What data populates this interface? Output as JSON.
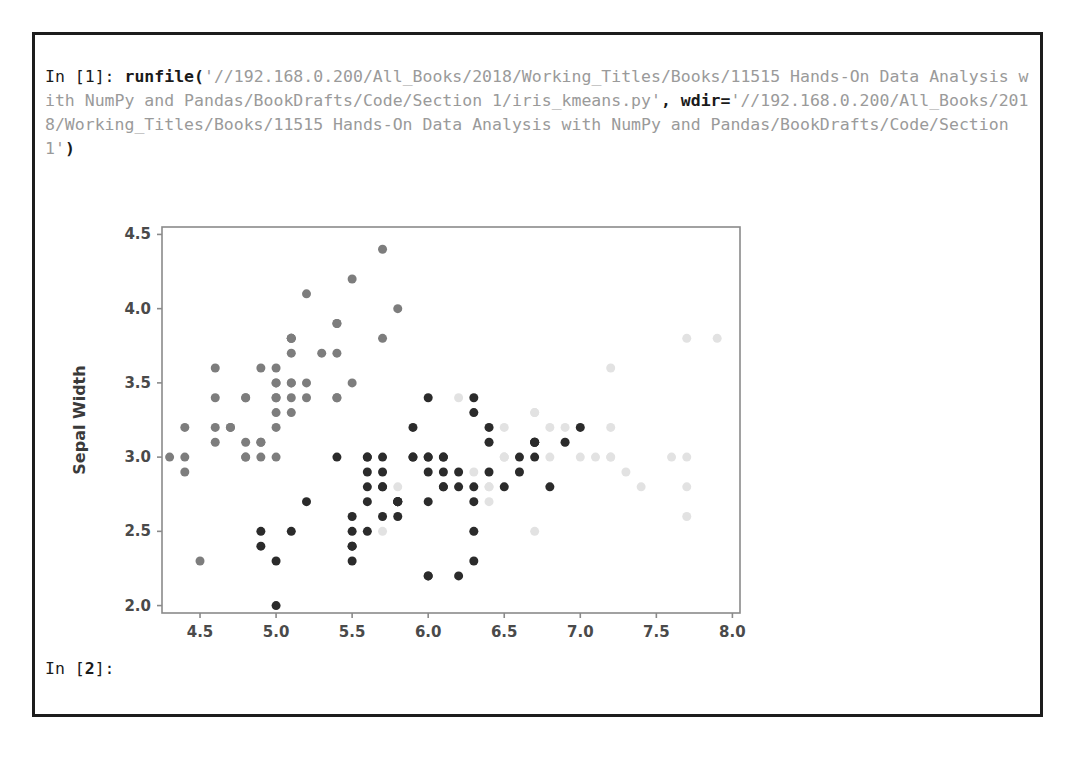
{
  "console": {
    "input_prompt_1": "In [1]:",
    "function_call": "runfile(",
    "arg1_string": "'//192.168.0.200/All_Books/2018/Working_Titles/Books/11515 Hands-On Data Analysis with NumPy and Pandas/BookDrafts/Code/Section 1/iris_kmeans.py'",
    "comma": ",",
    "kwarg_name": "wdir=",
    "arg2_string": "'//192.168.0.200/All_Books/2018/Working_Titles/Books/11515 Hands-On Data Analysis with NumPy and Pandas/BookDrafts/Code/Section 1'",
    "close_paren": ")",
    "input_prompt_2_pre": "In [",
    "input_prompt_2_num": "2",
    "input_prompt_2_post": "]:",
    "full_line_1": "In [1]: runfile('//192.168.0.200/All_Books/2018/Working_Titles/Books/11515 Hands-",
    "full_line_2": "On Data Analysis with NumPy and Pandas/BookDrafts/Code/Section 1/iris_kmeans.py',",
    "full_line_3": "wdir='//192.168.0.200/All_Books/2018/Working_Titles/Books/11515 Hands-On Data",
    "full_line_4": "Analysis with NumPy and Pandas/BookDrafts/Code/Section 1')"
  },
  "colors": {
    "frame_border": "#1c1c1c",
    "axis": "#8a8a8a",
    "text_dark": "#1a1a1a",
    "text_string": "#9a9a9a",
    "cluster_dark": "#2b2b2b",
    "cluster_medium": "#7d7d7d",
    "cluster_light": "#e2e2e2"
  },
  "chart_data": {
    "type": "scatter",
    "title": "",
    "xlabel": "Sepal Length",
    "ylabel": "Sepal Width",
    "xlim": [
      4.25,
      8.05
    ],
    "ylim": [
      1.95,
      4.55
    ],
    "xticks": [
      4.5,
      5.0,
      5.5,
      6.0,
      6.5,
      7.0,
      7.5,
      8.0
    ],
    "xtick_labels": [
      "4.5",
      "5.0",
      "5.5",
      "6.0",
      "6.5",
      "7.0",
      "7.5",
      "8.0"
    ],
    "yticks": [
      2.0,
      2.5,
      3.0,
      3.5,
      4.0,
      4.5
    ],
    "ytick_labels": [
      "2.0",
      "2.5",
      "3.0",
      "3.5",
      "4.0",
      "4.5"
    ],
    "grid": false,
    "legend": "none",
    "marker_size": 9,
    "series": [
      {
        "name": "cluster-0",
        "color": "#7d7d7d",
        "points": [
          [
            5.1,
            3.5
          ],
          [
            4.9,
            3.0
          ],
          [
            4.7,
            3.2
          ],
          [
            4.6,
            3.1
          ],
          [
            5.0,
            3.6
          ],
          [
            5.4,
            3.9
          ],
          [
            4.6,
            3.4
          ],
          [
            5.0,
            3.4
          ],
          [
            4.4,
            2.9
          ],
          [
            4.9,
            3.1
          ],
          [
            5.4,
            3.7
          ],
          [
            4.8,
            3.4
          ],
          [
            4.8,
            3.0
          ],
          [
            4.3,
            3.0
          ],
          [
            5.8,
            4.0
          ],
          [
            5.7,
            4.4
          ],
          [
            5.4,
            3.9
          ],
          [
            5.1,
            3.5
          ],
          [
            5.7,
            3.8
          ],
          [
            5.1,
            3.8
          ],
          [
            5.4,
            3.4
          ],
          [
            5.1,
            3.7
          ],
          [
            4.6,
            3.6
          ],
          [
            5.1,
            3.3
          ],
          [
            4.8,
            3.4
          ],
          [
            5.0,
            3.0
          ],
          [
            5.0,
            3.4
          ],
          [
            5.2,
            3.5
          ],
          [
            5.2,
            3.4
          ],
          [
            4.7,
            3.2
          ],
          [
            4.8,
            3.1
          ],
          [
            5.4,
            3.4
          ],
          [
            5.2,
            4.1
          ],
          [
            5.5,
            4.2
          ],
          [
            4.9,
            3.1
          ],
          [
            5.0,
            3.2
          ],
          [
            5.5,
            3.5
          ],
          [
            4.9,
            3.6
          ],
          [
            4.4,
            3.0
          ],
          [
            5.1,
            3.4
          ],
          [
            5.0,
            3.5
          ],
          [
            4.5,
            2.3
          ],
          [
            4.4,
            3.2
          ],
          [
            5.0,
            3.5
          ],
          [
            5.1,
            3.8
          ],
          [
            4.8,
            3.0
          ],
          [
            5.1,
            3.8
          ],
          [
            4.6,
            3.2
          ],
          [
            5.3,
            3.7
          ],
          [
            5.0,
            3.3
          ]
        ]
      },
      {
        "name": "cluster-1",
        "color": "#2b2b2b",
        "points": [
          [
            7.0,
            3.2
          ],
          [
            6.4,
            3.2
          ],
          [
            6.9,
            3.1
          ],
          [
            5.5,
            2.3
          ],
          [
            6.5,
            2.8
          ],
          [
            5.7,
            2.8
          ],
          [
            6.3,
            3.3
          ],
          [
            4.9,
            2.4
          ],
          [
            6.6,
            2.9
          ],
          [
            5.2,
            2.7
          ],
          [
            5.0,
            2.0
          ],
          [
            5.9,
            3.0
          ],
          [
            6.0,
            2.2
          ],
          [
            6.1,
            2.9
          ],
          [
            5.6,
            2.9
          ],
          [
            6.7,
            3.1
          ],
          [
            5.6,
            3.0
          ],
          [
            5.8,
            2.7
          ],
          [
            6.2,
            2.2
          ],
          [
            5.6,
            2.5
          ],
          [
            5.9,
            3.2
          ],
          [
            6.1,
            2.8
          ],
          [
            6.3,
            2.5
          ],
          [
            6.1,
            2.8
          ],
          [
            6.4,
            2.9
          ],
          [
            6.6,
            3.0
          ],
          [
            6.8,
            2.8
          ],
          [
            6.7,
            3.0
          ],
          [
            6.0,
            2.9
          ],
          [
            5.7,
            2.6
          ],
          [
            5.5,
            2.4
          ],
          [
            5.5,
            2.4
          ],
          [
            5.8,
            2.7
          ],
          [
            6.0,
            2.7
          ],
          [
            5.4,
            3.0
          ],
          [
            6.0,
            3.4
          ],
          [
            6.7,
            3.1
          ],
          [
            6.3,
            2.3
          ],
          [
            5.6,
            3.0
          ],
          [
            5.5,
            2.5
          ],
          [
            5.5,
            2.6
          ],
          [
            6.1,
            3.0
          ],
          [
            5.8,
            2.6
          ],
          [
            5.0,
            2.3
          ],
          [
            5.6,
            2.7
          ],
          [
            5.7,
            3.0
          ],
          [
            5.7,
            2.9
          ],
          [
            6.2,
            2.9
          ],
          [
            5.1,
            2.5
          ],
          [
            5.7,
            2.8
          ],
          [
            5.8,
            2.7
          ],
          [
            4.9,
            2.5
          ],
          [
            6.0,
            2.2
          ],
          [
            6.3,
            2.7
          ],
          [
            5.6,
            2.8
          ],
          [
            6.2,
            2.8
          ],
          [
            6.1,
            3.0
          ],
          [
            6.3,
            2.8
          ],
          [
            6.0,
            3.0
          ],
          [
            5.8,
            2.7
          ],
          [
            6.3,
            3.4
          ],
          [
            6.4,
            3.1
          ],
          [
            6.0,
            3.0
          ],
          [
            6.7,
            3.1
          ],
          [
            5.9,
            3.0
          ]
        ]
      },
      {
        "name": "cluster-2",
        "color": "#e2e2e2",
        "points": [
          [
            6.3,
            3.3
          ],
          [
            5.8,
            2.7
          ],
          [
            7.1,
            3.0
          ],
          [
            6.3,
            2.9
          ],
          [
            6.5,
            3.0
          ],
          [
            7.6,
            3.0
          ],
          [
            7.3,
            2.9
          ],
          [
            6.7,
            2.5
          ],
          [
            7.2,
            3.6
          ],
          [
            6.5,
            3.2
          ],
          [
            6.4,
            2.7
          ],
          [
            6.8,
            3.0
          ],
          [
            5.7,
            2.5
          ],
          [
            6.4,
            3.2
          ],
          [
            6.5,
            3.0
          ],
          [
            7.7,
            3.8
          ],
          [
            7.7,
            2.6
          ],
          [
            6.9,
            3.2
          ],
          [
            7.7,
            2.8
          ],
          [
            6.7,
            3.3
          ],
          [
            7.2,
            3.2
          ],
          [
            6.2,
            2.8
          ],
          [
            6.1,
            3.0
          ],
          [
            6.4,
            2.8
          ],
          [
            7.2,
            3.0
          ],
          [
            7.4,
            2.8
          ],
          [
            7.9,
            3.8
          ],
          [
            6.4,
            2.8
          ],
          [
            7.7,
            3.0
          ],
          [
            6.9,
            3.1
          ],
          [
            6.7,
            3.1
          ],
          [
            6.9,
            3.1
          ],
          [
            5.8,
            2.8
          ],
          [
            6.8,
            3.2
          ],
          [
            6.7,
            3.3
          ],
          [
            6.3,
            2.5
          ],
          [
            6.5,
            3.0
          ],
          [
            6.2,
            3.4
          ],
          [
            6.4,
            3.1
          ],
          [
            7.2,
            3.0
          ],
          [
            6.6,
            2.9
          ],
          [
            6.3,
            2.8
          ],
          [
            6.5,
            2.8
          ],
          [
            7.0,
            3.0
          ],
          [
            6.8,
            2.8
          ]
        ]
      }
    ]
  }
}
